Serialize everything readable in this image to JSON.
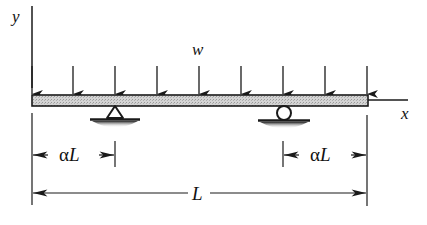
{
  "figure": {
    "axes": {
      "y_label": "y",
      "x_label": "x"
    },
    "load": {
      "label": "w",
      "type": "uniformly distributed",
      "arrow_count": 9
    },
    "supports": [
      {
        "type": "pin",
        "position_label": "αL from left end"
      },
      {
        "type": "roller",
        "position_label": "αL from right end"
      }
    ],
    "dimensions": {
      "left_overhang": {
        "alpha": "α",
        "symbol": "L",
        "text": "αL"
      },
      "right_overhang": {
        "alpha": "α",
        "symbol": "L",
        "text": "αL"
      },
      "total_length": {
        "text": "L"
      }
    },
    "colors": {
      "line": "#1a1a1a",
      "beam_fill": "#cfcfcf",
      "background": "#ffffff"
    }
  }
}
